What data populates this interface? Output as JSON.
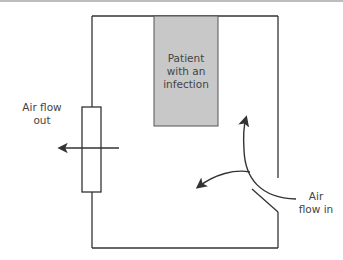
{
  "diagram": {
    "type": "room-airflow",
    "patient_box": {
      "label_lines": [
        "Patient",
        "with an",
        "infection"
      ],
      "fill": "#c8c8c8"
    },
    "air_out_label": [
      "Air flow",
      "out"
    ],
    "air_in_label": [
      "Air",
      "flow in"
    ],
    "colors": {
      "line": "#333333",
      "patient_fill": "#c8c8c8",
      "text": "#444444"
    }
  }
}
